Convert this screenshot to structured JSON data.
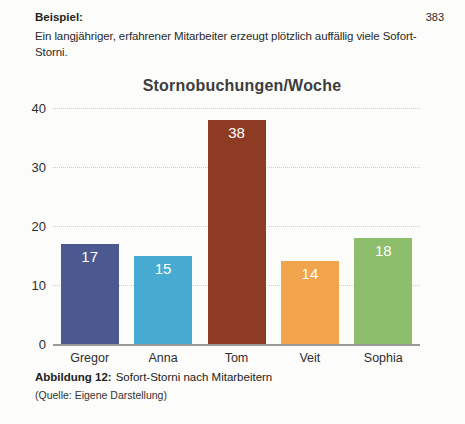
{
  "page": {
    "number": "383"
  },
  "header": {
    "example_label": "Beispiel:"
  },
  "paragraph": {
    "text": "Ein langjähriger, erfahrener Mitarbeiter erzeugt plötzlich auffällig viele Sofort-Storni."
  },
  "chart_data": {
    "type": "bar",
    "title": "Stornobuchungen/Woche",
    "categories": [
      "Gregor",
      "Anna",
      "Tom",
      "Veit",
      "Sophia"
    ],
    "values": [
      17,
      15,
      38,
      14,
      18
    ],
    "bar_colors": [
      "#4c5890",
      "#47aad0",
      "#8d3b22",
      "#f2a44c",
      "#8cbe6c"
    ],
    "value_label_color": "#ffffff",
    "xlabel": "",
    "ylabel": "",
    "ylim": [
      0,
      40
    ],
    "yticks": [
      0,
      10,
      20,
      30,
      40
    ],
    "grid": "horizontal-dotted",
    "legend": "none"
  },
  "caption": {
    "label": "Abbildung 12:",
    "text": "Sofort-Storni nach Mitarbeitern"
  },
  "source": {
    "text": "(Quelle: Eigene Darstellung)"
  }
}
